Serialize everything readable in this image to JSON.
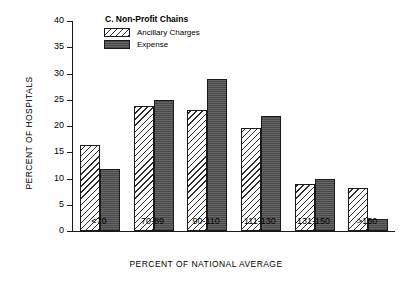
{
  "chart_data": {
    "type": "bar",
    "title": "C. Non-Profit Chains",
    "xlabel": "PERCENT OF NATIONAL AVERAGE",
    "ylabel": "PERCENT OF HOSPITALS",
    "categories": [
      "<70",
      "70-89",
      "90-110",
      "111-130",
      "131-150",
      ">150"
    ],
    "series": [
      {
        "name": "Ancillary Charges",
        "values": [
          16.3,
          23.8,
          23.0,
          19.7,
          9.0,
          8.1
        ],
        "fill": "hatch",
        "color": "#ffffff"
      },
      {
        "name": "Expense",
        "values": [
          11.8,
          25.0,
          29.0,
          22.0,
          10.0,
          2.2
        ],
        "fill": "solid",
        "color": "#5a5a5a"
      }
    ],
    "ylim": [
      0,
      40
    ],
    "yticks": [
      0,
      5,
      10,
      15,
      20,
      25,
      30,
      35,
      40
    ],
    "ytick_labels": [
      "0",
      "5",
      "10",
      "15",
      "20",
      "25",
      "30",
      "35",
      "40"
    ],
    "grid": false,
    "legend_position": "top-left-inside"
  }
}
